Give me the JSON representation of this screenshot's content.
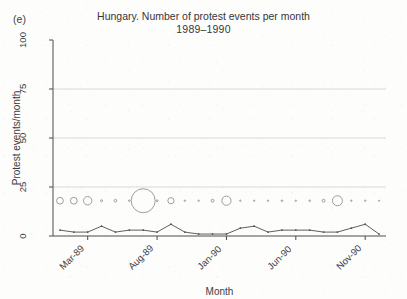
{
  "figure": {
    "panel_label": "(e)",
    "title_line1": "Hungary. Number of protest events per month",
    "title_line2": "1989–1990"
  },
  "chart_data": {
    "type": "scatter",
    "title": "Hungary. Number of protest events per month 1989–1990",
    "xlabel": "Month",
    "ylabel": "Protest events/month",
    "ylim": [
      0,
      100
    ],
    "yticks": [
      0,
      25,
      50,
      75,
      100
    ],
    "ytick_labels": [
      "0",
      "25",
      "50",
      "75",
      "100"
    ],
    "grid": "horizontal-at-25-50-75",
    "legend": "none",
    "xtick_labels": [
      "Mar-89",
      "Aug-89",
      "Jan-90",
      "Jun-90",
      "Nov-90"
    ],
    "xtick_index": [
      2,
      7,
      12,
      17,
      22
    ],
    "x": [
      "Jan-89",
      "Feb-89",
      "Mar-89",
      "Apr-89",
      "May-89",
      "Jun-89",
      "Jul-89",
      "Aug-89",
      "Sep-89",
      "Oct-89",
      "Nov-89",
      "Dec-89",
      "Jan-90",
      "Feb-90",
      "Mar-90",
      "Apr-90",
      "May-90",
      "Jun-90",
      "Jul-90",
      "Aug-90",
      "Sep-90",
      "Oct-90",
      "Nov-90",
      "Dec-90"
    ],
    "series": [
      {
        "name": "Protest events per month",
        "type": "line",
        "marker": "small-dot",
        "values": [
          3,
          2,
          2,
          5,
          2,
          3,
          3,
          2,
          6,
          2,
          1,
          1,
          1,
          4,
          5,
          2,
          3,
          3,
          3,
          2,
          2,
          4,
          6,
          1
        ]
      },
      {
        "name": "Bubble overlay (event magnitude)",
        "type": "bubble",
        "y_constant": 18,
        "radii": [
          3.4,
          3.4,
          4.2,
          1.0,
          1.3,
          0.8,
          12.0,
          0.9,
          3.1,
          0.7,
          0.7,
          1.4,
          4.6,
          0.7,
          0.7,
          0.7,
          0.8,
          0.7,
          0.8,
          1.4,
          5.0,
          0.7,
          0.7,
          0.6
        ]
      }
    ]
  },
  "colors": {
    "axis": "#4a4a4a",
    "grid": "#c9c9c9",
    "line": "#4d4d4d",
    "bubble_stroke": "#8c8c8c",
    "background": "#fdfdfc"
  }
}
